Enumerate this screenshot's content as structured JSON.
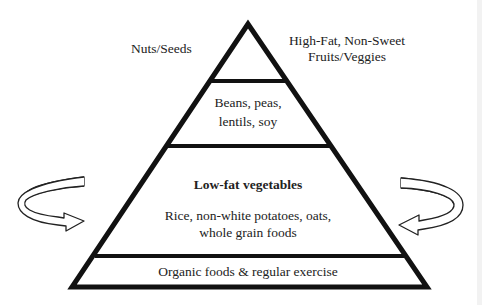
{
  "diagram": {
    "type": "food-pyramid",
    "colors": {
      "outline": "#111111",
      "arrow_fill": "#d0d0d0",
      "arrow_stroke": "#222222",
      "text": "#222222",
      "background": "#ffffff"
    },
    "side_labels": {
      "left": "Nuts/Seeds",
      "right_line1": "High-Fat, Non-Sweet",
      "right_line2": "Fruits/Veggies"
    },
    "tiers": [
      {
        "name": "top",
        "lines": []
      },
      {
        "name": "beans",
        "line1": "Beans, peas,",
        "line2": "lentils, soy"
      },
      {
        "name": "vegetables-grains",
        "heading": "Low-fat vegetables",
        "line1": "Rice, non-white potatoes, oats,",
        "line2": "whole grain foods"
      },
      {
        "name": "base",
        "line1": "Organic foods & regular exercise"
      }
    ],
    "arrows": [
      {
        "name": "left-curved-arrow",
        "direction": "pointing-right"
      },
      {
        "name": "right-curved-arrow",
        "direction": "pointing-left"
      }
    ]
  }
}
